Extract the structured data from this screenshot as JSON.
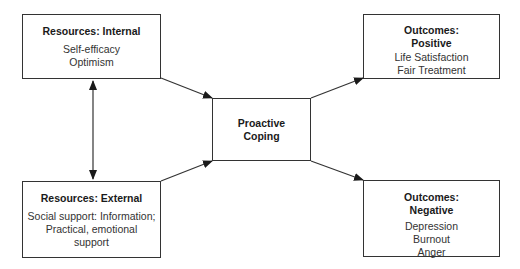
{
  "diagram": {
    "nodes": {
      "resources_internal": {
        "title": "Resources: Internal",
        "items": [
          "Self-efficacy",
          "Optimism"
        ]
      },
      "resources_external": {
        "title": "Resources: External",
        "items": [
          "Social support: Information;",
          "Practical, emotional",
          "support"
        ]
      },
      "proactive_coping": {
        "title_lines": [
          "Proactive",
          "Coping"
        ]
      },
      "outcomes_positive": {
        "title_lines": [
          "Outcomes:",
          "Positive"
        ],
        "items": [
          "Life Satisfaction",
          "Fair Treatment"
        ]
      },
      "outcomes_negative": {
        "title_lines": [
          "Outcomes:",
          "Negative"
        ],
        "items": [
          "Depression",
          "Burnout",
          "Anger"
        ]
      }
    },
    "edges": [
      {
        "from": "resources_internal",
        "to": "resources_external",
        "type": "bidirectional"
      },
      {
        "from": "resources_internal",
        "to": "proactive_coping",
        "type": "directed"
      },
      {
        "from": "resources_external",
        "to": "proactive_coping",
        "type": "directed"
      },
      {
        "from": "proactive_coping",
        "to": "outcomes_positive",
        "type": "directed"
      },
      {
        "from": "proactive_coping",
        "to": "outcomes_negative",
        "type": "directed"
      }
    ],
    "colors": {
      "line": "#333333",
      "background": "#ffffff",
      "text": "#222222"
    }
  }
}
